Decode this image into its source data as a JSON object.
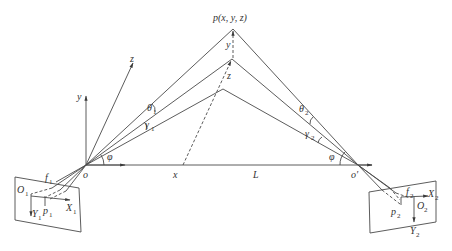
{
  "figure": {
    "point_label": "p(x, y, z)",
    "axes": {
      "x": "x",
      "y": "y",
      "z": "z"
    },
    "point_components": {
      "y": "y",
      "z": "z"
    },
    "baseline_label": "L",
    "left_camera": {
      "origin": "o",
      "angle_phi": "φ",
      "angle_theta": "θ",
      "theta_sub": "1",
      "angle_gamma": "γ",
      "gamma_sub": "1",
      "focal": "f",
      "focal_sub": "1",
      "image_origin": "O",
      "image_origin_sub": "1",
      "image_point": "p",
      "image_point_sub": "1",
      "image_x": "X",
      "image_x_sub": "1",
      "image_y": "Y",
      "image_y_sub": "1"
    },
    "right_camera": {
      "origin": "o′",
      "angle_phi": "φ",
      "angle_theta": "θ",
      "theta_sub": "2",
      "angle_gamma": "γ",
      "gamma_sub": "2",
      "focal": "f",
      "focal_sub": "2",
      "image_origin": "O",
      "image_origin_sub": "2",
      "image_point": "p",
      "image_point_sub": "2",
      "image_x": "X",
      "image_x_sub": "2",
      "image_y": "Y",
      "image_y_sub": "2"
    },
    "colors": {
      "line": "#4a4a4a",
      "text": "#333333",
      "background": "#ffffff"
    }
  }
}
